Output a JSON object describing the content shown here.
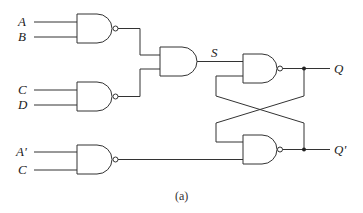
{
  "diagram": {
    "type": "logic-circuit",
    "caption": "(a)",
    "colors": {
      "line": "#333333",
      "background": "#ffffff"
    },
    "inputs": {
      "gate1": [
        "A",
        "B"
      ],
      "gate2": [
        "C",
        "D"
      ],
      "gate3": [
        "A'",
        "C"
      ]
    },
    "signals": {
      "s": "S"
    },
    "outputs": {
      "q": "Q",
      "q_prime": "Q'"
    },
    "gates": [
      {
        "id": "nand1",
        "type": "NAND",
        "inputs": [
          "A",
          "B"
        ]
      },
      {
        "id": "nand2",
        "type": "NAND",
        "inputs": [
          "C",
          "D"
        ]
      },
      {
        "id": "and1",
        "type": "AND",
        "inputs": [
          "nand1",
          "nand2"
        ],
        "output": "S"
      },
      {
        "id": "nand3",
        "type": "NAND",
        "inputs": [
          "A'",
          "C"
        ]
      },
      {
        "id": "latch_top",
        "type": "NAND",
        "inputs": [
          "S",
          "Q'"
        ],
        "output": "Q"
      },
      {
        "id": "latch_bottom",
        "type": "NAND",
        "inputs": [
          "Q",
          "nand3"
        ],
        "output": "Q'"
      }
    ]
  }
}
